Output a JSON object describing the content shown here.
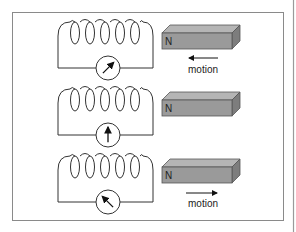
{
  "diagram": {
    "colors": {
      "frame": "#8a8a8a",
      "wire": "#333333",
      "magnet_front": "#9a9a9a",
      "magnet_top": "#b5b5b5",
      "magnet_side": "#7d7d7d",
      "page_edge": "#9a9a9a"
    },
    "rows": [
      {
        "magnet_pole_label": "N",
        "motion_direction": "left",
        "motion_label": "motion",
        "meter_needle": "deflected-right",
        "needle_angle_deg": 45
      },
      {
        "magnet_pole_label": "N",
        "motion_direction": "none",
        "motion_label": "",
        "meter_needle": "center",
        "needle_angle_deg": 0
      },
      {
        "magnet_pole_label": "N",
        "motion_direction": "right",
        "motion_label": "motion",
        "meter_needle": "deflected-left",
        "needle_angle_deg": -45
      }
    ]
  }
}
